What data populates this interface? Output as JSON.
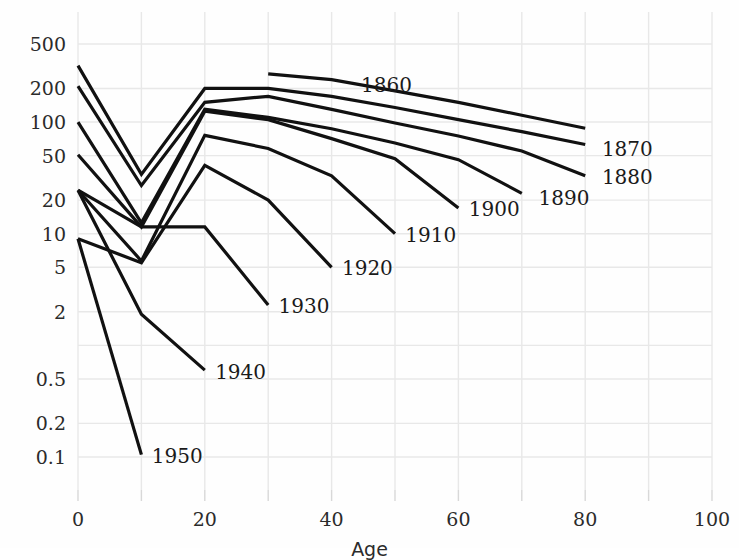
{
  "chart_data": {
    "type": "line",
    "title": "",
    "xlabel": "Age",
    "ylabel": "",
    "xlim": [
      0,
      100
    ],
    "ylim": [
      0.08,
      700
    ],
    "yscale": "log",
    "xscale": "linear",
    "grid": true,
    "legend_position": "inline-end-of-line",
    "xticks": [
      0,
      20,
      40,
      60,
      80,
      100
    ],
    "xticklabels": [
      "0",
      "20",
      "40",
      "60",
      "80",
      "100"
    ],
    "xminorticks": [
      10,
      30,
      50,
      70,
      90
    ],
    "yticks": [
      500,
      200,
      100,
      50,
      20,
      10,
      5,
      2,
      1,
      0.5,
      0.2,
      0.1
    ],
    "yticklabels": [
      "500",
      "200",
      "100",
      "50",
      "20",
      "10",
      "5",
      "2",
      "",
      "0.5",
      "0.2",
      "0.1"
    ],
    "line_color": "#111111",
    "line_width": 3.2,
    "grid_color": "#e8e8e8",
    "series": [
      {
        "name": "1860",
        "label": "1860",
        "x": [
          30,
          40,
          50,
          60,
          70,
          80
        ],
        "values": [
          270,
          240,
          190,
          150,
          115,
          88
        ],
        "label_x": 44,
        "label_y": 215
      },
      {
        "name": "1870",
        "label": "1870",
        "x": [
          0,
          10,
          20,
          30,
          40,
          50,
          60,
          70,
          80
        ],
        "values": [
          320,
          34,
          200,
          200,
          170,
          135,
          105,
          82,
          63
        ],
        "label_x": 82,
        "label_y": 57
      },
      {
        "name": "1880",
        "label": "1880",
        "x": [
          0,
          10,
          20,
          30,
          40,
          50,
          60,
          70,
          80
        ],
        "values": [
          210,
          27,
          150,
          170,
          130,
          98,
          75,
          55,
          33
        ],
        "label_x": 82,
        "label_y": 32
      },
      {
        "name": "1890",
        "label": "1890",
        "x": [
          0,
          10,
          20,
          30,
          40,
          50,
          60,
          70
        ],
        "values": [
          100,
          12.5,
          130,
          110,
          87,
          65,
          46,
          23
        ],
        "label_x": 72,
        "label_y": 21
      },
      {
        "name": "1900",
        "label": "1900",
        "x": [
          0,
          10,
          20,
          30,
          40,
          50,
          60
        ],
        "values": [
          51,
          11.5,
          125,
          105,
          71,
          47,
          17
        ],
        "label_x": 61,
        "label_y": 16.5
      },
      {
        "name": "1910",
        "label": "1910",
        "x": [
          0,
          10,
          20,
          30,
          40,
          50
        ],
        "values": [
          24.5,
          5.7,
          76,
          58,
          33,
          10
        ],
        "label_x": 51,
        "label_y": 9.7
      },
      {
        "name": "1920",
        "label": "1920",
        "x": [
          0,
          10,
          20,
          30,
          40
        ],
        "values": [
          9,
          5.5,
          41,
          20,
          5
        ],
        "label_x": 41,
        "label_y": 4.9
      },
      {
        "name": "1930",
        "label": "1930",
        "x": [
          0,
          10,
          20,
          30
        ],
        "values": [
          24.5,
          11.5,
          11.5,
          2.3
        ],
        "label_x": 31,
        "label_y": 2.25
      },
      {
        "name": "1940",
        "label": "1940",
        "x": [
          0,
          10,
          20
        ],
        "values": [
          24.5,
          1.9,
          0.6
        ],
        "label_x": 21,
        "label_y": 0.58
      },
      {
        "name": "1950",
        "label": "1950",
        "x": [
          0,
          10
        ],
        "values": [
          9,
          0.105
        ],
        "label_x": 11,
        "label_y": 0.102
      }
    ]
  }
}
